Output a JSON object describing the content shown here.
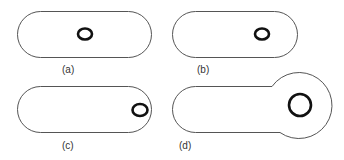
{
  "figure": {
    "panels": [
      {
        "id": "a",
        "label": "(a)",
        "shape": "stadium",
        "inner": "small ring centered"
      },
      {
        "id": "b",
        "label": "(b)",
        "shape": "stadium",
        "inner": "small ring right of center"
      },
      {
        "id": "c",
        "label": "(c)",
        "shape": "stadium",
        "inner": "small ring at right end"
      },
      {
        "id": "d",
        "label": "(d)",
        "shape": "stadium with bulb at right end",
        "inner": "larger ring in bulb"
      }
    ],
    "colors": {
      "outline": "#555555",
      "ring": "#111111",
      "background": "#ffffff"
    }
  }
}
